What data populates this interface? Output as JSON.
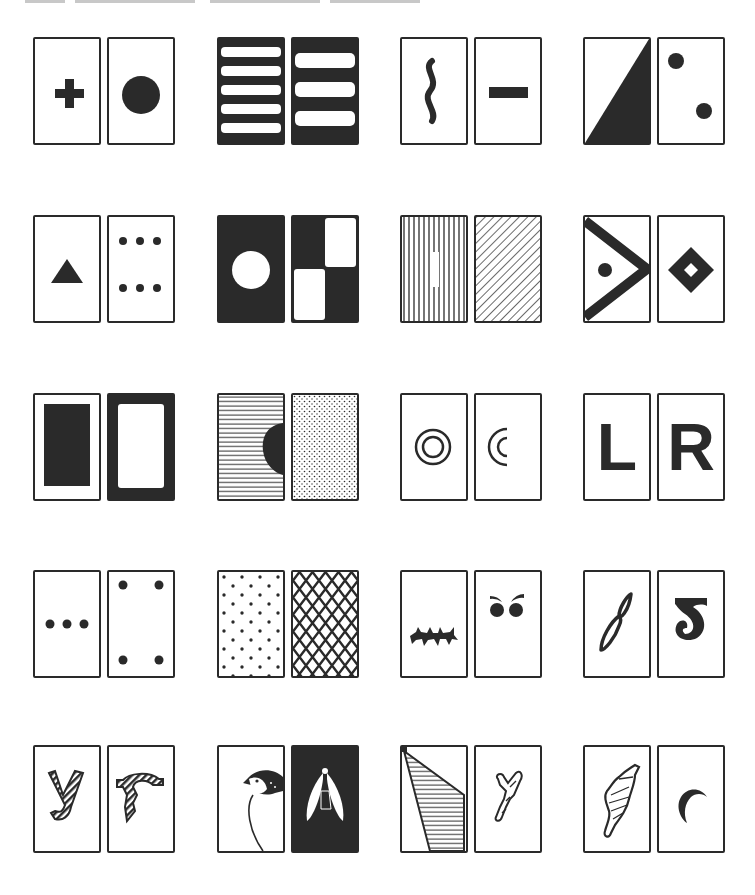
{
  "figure": {
    "layout": {
      "rows": 5,
      "columns": 4,
      "cards_per_pair": 2
    },
    "colors": {
      "ink": "#2a2a2a",
      "paper": "#ffffff"
    },
    "pairs": [
      {
        "row": 1,
        "col": 1,
        "left": "cross",
        "right": "filled-circle"
      },
      {
        "row": 1,
        "col": 2,
        "left": "five-white-bars-on-black",
        "right": "three-white-bars-on-black"
      },
      {
        "row": 1,
        "col": 3,
        "left": "wavy-vertical-line",
        "right": "short-horizontal-bar"
      },
      {
        "row": 1,
        "col": 4,
        "left": "black-diagonal-triangle",
        "right": "two-dots-diagonal"
      },
      {
        "row": 2,
        "col": 1,
        "left": "filled-triangle",
        "right": "six-dots"
      },
      {
        "row": 2,
        "col": 2,
        "left": "white-circle-on-black",
        "right": "checkerboard-quadrants"
      },
      {
        "row": 2,
        "col": 3,
        "left": "vertical-stripes",
        "right": "diagonal-stripes"
      },
      {
        "row": 2,
        "col": 4,
        "left": "chevron-with-dot",
        "right": "hollow-diamond"
      },
      {
        "row": 3,
        "col": 1,
        "left": "black-rectangle-white-border",
        "right": "white-rectangle-black-border"
      },
      {
        "row": 3,
        "col": 2,
        "left": "horizontal-lines-with-half-disc",
        "right": "stippled-dots"
      },
      {
        "row": 3,
        "col": 3,
        "left": "concentric-circles",
        "right": "concentric-arcs"
      },
      {
        "row": 3,
        "col": 4,
        "left": "L",
        "right": "R"
      },
      {
        "row": 4,
        "col": 1,
        "left": "three-dots-row",
        "right": "four-corner-dots"
      },
      {
        "row": 4,
        "col": 2,
        "left": "dot-grid-pattern",
        "right": "diamond-lattice"
      },
      {
        "row": 4,
        "col": 3,
        "left": "spiky-caterpillar",
        "right": "angry-eyes"
      },
      {
        "row": 4,
        "col": 4,
        "left": "figure-eight-loop",
        "right": "inverted-2"
      },
      {
        "row": 5,
        "col": 1,
        "left": "patterned-letter-y",
        "right": "patterned-letter-r"
      },
      {
        "row": 5,
        "col": 2,
        "left": "bird-head",
        "right": "moth-on-black"
      },
      {
        "row": 5,
        "col": 3,
        "left": "hatched-wedge",
        "right": "branching-twig"
      },
      {
        "row": 5,
        "col": 4,
        "left": "pine-cone",
        "right": "crescent-moon"
      }
    ],
    "letters": {
      "l": "L",
      "r": "R"
    }
  }
}
